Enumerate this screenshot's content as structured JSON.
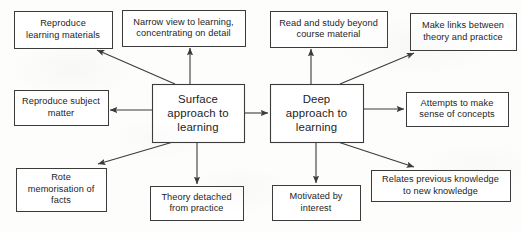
{
  "diagram": {
    "type": "concept-map",
    "background_color": "#fdfdfc",
    "line_color": "#3b3b3b",
    "text_color": "#1d1d1d",
    "nodes": [
      {
        "id": "surface-approach",
        "label": "Surface\napproach to\nlearning",
        "role": "central",
        "x": 152,
        "y": 84,
        "w": 92,
        "h": 58
      },
      {
        "id": "deep-approach",
        "label": "Deep\napproach to\nlearning",
        "role": "central",
        "x": 270,
        "y": 84,
        "w": 93,
        "h": 58
      },
      {
        "id": "reproduce-learning-materials",
        "label": "Reproduce\nlearning materials",
        "role": "surface-outcome",
        "x": 14,
        "y": 11,
        "w": 98,
        "h": 37
      },
      {
        "id": "narrow-view",
        "label": "Narrow view to learning,\nconcentrating on detail",
        "role": "surface-outcome",
        "x": 122,
        "y": 10,
        "w": 123,
        "h": 36
      },
      {
        "id": "reproduce-subject-matter",
        "label": "Reproduce subject\nmatter",
        "role": "surface-outcome",
        "x": 14,
        "y": 90,
        "w": 94,
        "h": 35
      },
      {
        "id": "rote-memorisation",
        "label": "Rote\nmemorisation of\nfacts",
        "role": "surface-outcome",
        "x": 16,
        "y": 168,
        "w": 90,
        "h": 43
      },
      {
        "id": "theory-detached",
        "label": "Theory detached\nfrom practice",
        "role": "surface-outcome",
        "x": 150,
        "y": 186,
        "w": 93,
        "h": 34
      },
      {
        "id": "read-and-study-beyond",
        "label": "Read and study beyond\ncourse material",
        "role": "deep-outcome",
        "x": 270,
        "y": 11,
        "w": 117,
        "h": 36
      },
      {
        "id": "make-links",
        "label": "Make links between\ntheory and practice",
        "role": "deep-outcome",
        "x": 410,
        "y": 13,
        "w": 106,
        "h": 37
      },
      {
        "id": "attempts-sense-of-concepts",
        "label": "Attempts to make\nsense of concepts",
        "role": "deep-outcome",
        "x": 406,
        "y": 92,
        "w": 102,
        "h": 34
      },
      {
        "id": "relates-previous-knowledge",
        "label": "Relates previous knowledge\nto new knowledge",
        "role": "deep-outcome",
        "x": 371,
        "y": 170,
        "w": 139,
        "h": 31
      },
      {
        "id": "motivated-by-interest",
        "label": "Motivated by\ninterest",
        "role": "deep-outcome",
        "x": 272,
        "y": 185,
        "w": 88,
        "h": 35
      }
    ],
    "edges": [
      {
        "id": "surface-to-reproduce-materials",
        "from": "surface-approach",
        "to": "reproduce-learning-materials",
        "x1": 175,
        "y1": 84,
        "x2": 97,
        "y2": 50,
        "arrow": "end"
      },
      {
        "id": "surface-to-narrow-view",
        "from": "surface-approach",
        "to": "narrow-view",
        "x1": 190,
        "y1": 84,
        "x2": 190,
        "y2": 48,
        "arrow": "end"
      },
      {
        "id": "surface-to-reproduce-subject",
        "from": "surface-approach",
        "to": "reproduce-subject-matter",
        "x1": 152,
        "y1": 110,
        "x2": 110,
        "y2": 110,
        "arrow": "end"
      },
      {
        "id": "surface-to-rote-memorisation",
        "from": "surface-approach",
        "to": "rote-memorisation",
        "x1": 173,
        "y1": 142,
        "x2": 98,
        "y2": 164,
        "arrow": "end"
      },
      {
        "id": "surface-to-theory-detached",
        "from": "surface-approach",
        "to": "theory-detached",
        "x1": 197,
        "y1": 142,
        "x2": 197,
        "y2": 184,
        "arrow": "end"
      },
      {
        "id": "surface-to-deep",
        "from": "surface-approach",
        "to": "deep-approach",
        "x1": 245,
        "y1": 113,
        "x2": 268,
        "y2": 113,
        "arrow": "both"
      },
      {
        "id": "deep-to-read-beyond",
        "from": "deep-approach",
        "to": "read-and-study-beyond",
        "x1": 311,
        "y1": 84,
        "x2": 311,
        "y2": 49,
        "arrow": "end"
      },
      {
        "id": "deep-to-make-links",
        "from": "deep-approach",
        "to": "make-links",
        "x1": 340,
        "y1": 84,
        "x2": 414,
        "y2": 53,
        "arrow": "end"
      },
      {
        "id": "deep-to-attempts-sense",
        "from": "deep-approach",
        "to": "attempts-sense-of-concepts",
        "x1": 363,
        "y1": 109,
        "x2": 404,
        "y2": 109,
        "arrow": "end"
      },
      {
        "id": "deep-to-relates-knowledge",
        "from": "deep-approach",
        "to": "relates-previous-knowledge",
        "x1": 338,
        "y1": 142,
        "x2": 414,
        "y2": 167,
        "arrow": "end"
      },
      {
        "id": "deep-to-motivated",
        "from": "deep-approach",
        "to": "motivated-by-interest",
        "x1": 316,
        "y1": 142,
        "x2": 316,
        "y2": 183,
        "arrow": "end"
      }
    ]
  }
}
